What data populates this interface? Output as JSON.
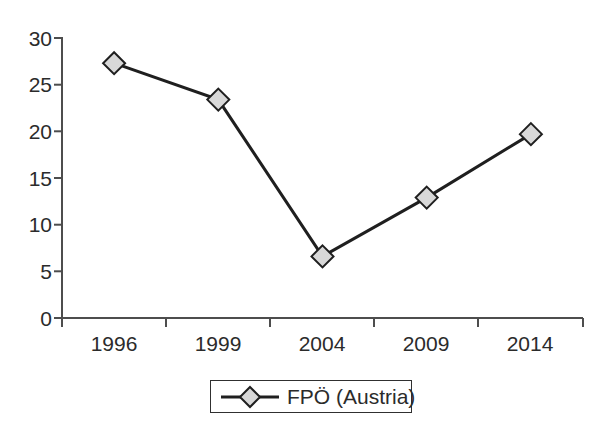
{
  "chart_data": {
    "type": "line",
    "title": "",
    "subtitle": "",
    "xlabel": "",
    "ylabel": "",
    "categories": [
      "1996",
      "1999",
      "2004",
      "2009",
      "2014"
    ],
    "series": [
      {
        "name": "FPÖ (Austria)",
        "values": [
          27.3,
          23.4,
          6.6,
          12.9,
          19.7
        ],
        "marker": "diamond",
        "marker_fill": "#d8d8d8",
        "marker_edge": "#1f1f1f",
        "line_color": "#1f1f1f"
      }
    ],
    "x_tick_labels": [
      "1996",
      "1999",
      "2004",
      "2009",
      "2014"
    ],
    "y_tick_labels": [
      "0",
      "5",
      "10",
      "15",
      "20",
      "25",
      "30"
    ],
    "y_tick_values": [
      0,
      5,
      10,
      15,
      20,
      25,
      30
    ],
    "ylim": [
      0,
      30
    ],
    "grid": false,
    "legend": {
      "position": "bottom-center",
      "entries": [
        {
          "label": "FPÖ (Austria)",
          "marker": "diamond"
        }
      ]
    },
    "axis_color": "#4d4d4d",
    "background": "#ffffff"
  },
  "legend": {
    "label": "FPÖ (Austria)"
  },
  "axes": {
    "y_labels": [
      "30",
      "25",
      "20",
      "15",
      "10",
      "5",
      "0"
    ],
    "x_labels": [
      "1996",
      "1999",
      "2004",
      "2009",
      "2014"
    ]
  }
}
